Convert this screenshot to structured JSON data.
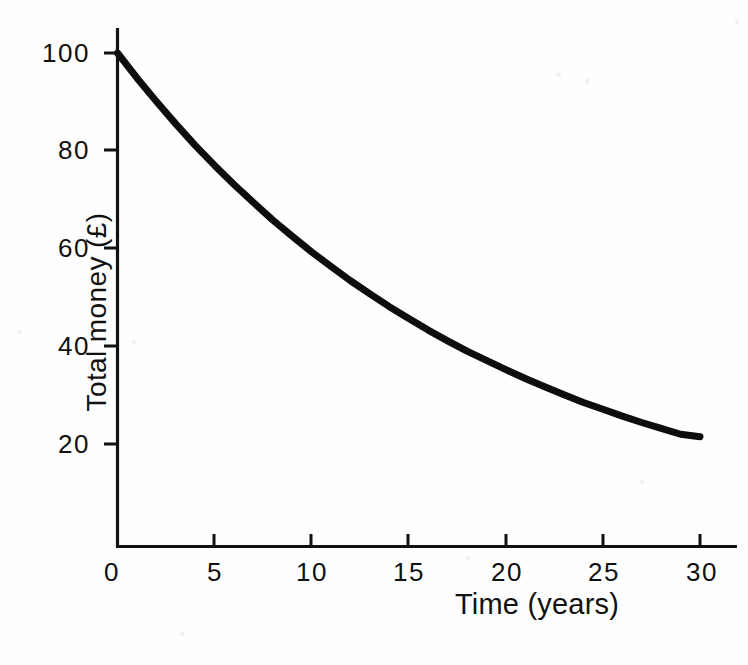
{
  "figure": {
    "background_color": "#fefefe",
    "line_color": "#0d0d0d",
    "axis_color": "#111111"
  },
  "axis_titles": {
    "y": "Total money  (£)",
    "x": "Time (years)"
  },
  "chart_data": {
    "type": "line",
    "title": "",
    "subtitle": "",
    "xlabel": "Time (years)",
    "ylabel": "Total money  (£)",
    "xlim": [
      0,
      32
    ],
    "ylim": [
      0,
      105
    ],
    "grid": false,
    "legend": null,
    "xticks": [
      0,
      5,
      10,
      15,
      20,
      25,
      30
    ],
    "xticklabels": [
      "0",
      "5",
      "10",
      "15",
      "20",
      "25",
      "30"
    ],
    "yticks": [
      20,
      40,
      60,
      80,
      100
    ],
    "yticklabels": [
      "20",
      "40",
      "60",
      "80",
      "100"
    ],
    "series": [
      {
        "name": "Total money",
        "x": [
          0,
          1,
          2,
          3,
          4,
          5,
          6,
          7,
          8,
          9,
          10,
          11,
          12,
          13,
          14,
          15,
          16,
          17,
          18,
          19,
          20,
          21,
          22,
          23,
          24,
          25,
          26,
          27,
          28,
          29,
          30
        ],
        "values": [
          100.0,
          94.9,
          90.1,
          85.5,
          81.1,
          77.0,
          73.1,
          69.4,
          65.8,
          62.5,
          59.3,
          56.3,
          53.4,
          50.7,
          48.1,
          45.7,
          43.3,
          41.1,
          39.0,
          37.1,
          35.2,
          33.4,
          31.7,
          30.1,
          28.5,
          27.1,
          25.7,
          24.4,
          23.2,
          22.0,
          21.5
        ]
      }
    ],
    "annotations": []
  }
}
